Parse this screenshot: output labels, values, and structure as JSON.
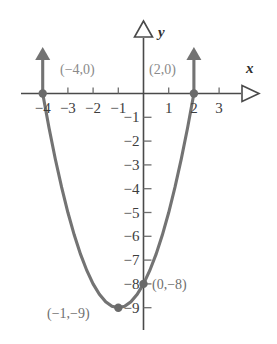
{
  "chart_data": {
    "type": "line",
    "title": "",
    "xlabel": "x",
    "ylabel": "y",
    "grid": false,
    "legend": "none",
    "xlim": [
      -4.8,
      3.8
    ],
    "ylim": [
      -9.8,
      1.6
    ],
    "x_ticks": [
      -4,
      -3,
      -2,
      -1,
      1,
      2,
      3
    ],
    "x_tick_labels": [
      "−4",
      "−3",
      "−2",
      "−1",
      "1",
      "2",
      "3"
    ],
    "y_ticks": [
      -1,
      -2,
      -3,
      -4,
      -5,
      -6,
      -7,
      -8,
      -9
    ],
    "y_tick_labels": [
      "−1",
      "−2",
      "−3",
      "−4",
      "−5",
      "−6",
      "−7",
      "−8",
      "−9"
    ],
    "series": [
      {
        "name": "parabola",
        "equation_implied": "y = x^2 + 2x - 8",
        "color": "#737373",
        "x": [
          -4.0,
          -3.75,
          -3.5,
          -3.25,
          -3.0,
          -2.75,
          -2.5,
          -2.25,
          -2.0,
          -1.75,
          -1.5,
          -1.25,
          -1.0,
          -0.75,
          -0.5,
          -0.25,
          0.0,
          0.25,
          0.5,
          0.75,
          1.0,
          1.25,
          1.5,
          1.75,
          2.0
        ],
        "y": [
          0.0,
          -1.4375,
          -2.75,
          -3.9375,
          -5.0,
          -5.9375,
          -6.75,
          -7.4375,
          -8.0,
          -8.4375,
          -8.75,
          -8.9375,
          -9.0,
          -8.9375,
          -8.75,
          -8.4375,
          -8.0,
          -7.4375,
          -6.75,
          -5.9375,
          -5.0,
          -3.9375,
          -2.75,
          -1.4375,
          0.0
        ]
      }
    ],
    "points": [
      {
        "id": "root-left",
        "x": -4,
        "y": 0,
        "label": "(−4,0)",
        "label_pos": "upper-right"
      },
      {
        "id": "root-right",
        "x": 2,
        "y": 0,
        "label": "(2,0)",
        "label_pos": "upper-left"
      },
      {
        "id": "y-intercept",
        "x": 0,
        "y": -8,
        "label": "(0,−8)",
        "label_pos": "right"
      },
      {
        "id": "vertex",
        "x": -1,
        "y": -9,
        "label": "(−1,−9)",
        "label_pos": "left"
      }
    ],
    "ray_arrows": [
      {
        "at_x": -4,
        "direction": "up",
        "note": "curve continues upward"
      },
      {
        "at_x": 2,
        "direction": "up",
        "note": "curve continues upward"
      }
    ],
    "axis_arrow_style": "open-triangle",
    "colors": {
      "curve": "#737373",
      "axis": "#4a4a4a",
      "tick": "#6e6e6e",
      "point": "#6a6a6a",
      "label": "#8a8a8a",
      "background": "#ffffff"
    }
  }
}
